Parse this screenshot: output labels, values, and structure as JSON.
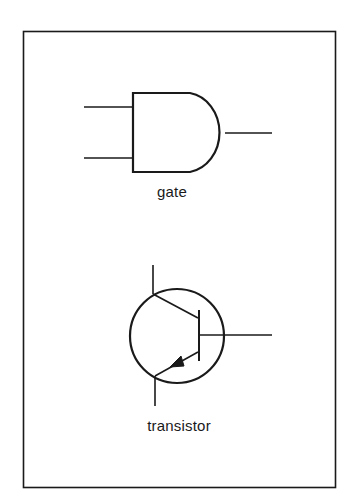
{
  "diagram": {
    "type": "circuit-symbols",
    "frame": {
      "stroke_color": "#1a1a1a",
      "background": "#ffffff"
    },
    "symbols": [
      {
        "id": "and-gate",
        "kind": "AND gate",
        "label": "gate",
        "inputs": 2,
        "outputs": 1
      },
      {
        "id": "transistor",
        "kind": "bipolar junction transistor (PNP-style emitter arrow)",
        "label": "transistor",
        "terminals": [
          "collector",
          "base",
          "emitter"
        ]
      }
    ],
    "stroke_color": "#1a1a1a"
  }
}
